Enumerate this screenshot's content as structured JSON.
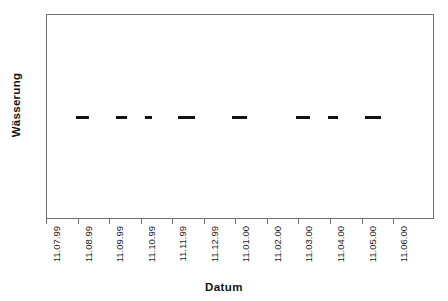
{
  "chart_data": {
    "type": "bar",
    "orientation": "horizontal",
    "title": "",
    "xlabel": "Datum",
    "ylabel": "Wässerung",
    "grid": false,
    "legend": null,
    "categories": [
      "Wässerung"
    ],
    "x_tick_labels": [
      "11.07.99",
      "11.08.99",
      "11.09.99",
      "11.10.99",
      "11.11.99",
      "11.12.99",
      "11.01.00",
      "11.02.00",
      "11.03.00",
      "11.04.00",
      "11.05.00",
      "11.06.00"
    ],
    "x_axis_range": [
      "11.07.99",
      "11.06.00"
    ],
    "y_axis_ticks": [],
    "series": [
      {
        "name": "Wässerung",
        "marker": "horizontal-segment",
        "color": "#121212",
        "segments": [
          {
            "index": 1,
            "start": "01.08.99",
            "end": "13.08.99",
            "x_start_px": 76,
            "x_end_px": 89
          },
          {
            "index": 2,
            "start": "06.09.99",
            "end": "16.09.99",
            "x_start_px": 116,
            "x_end_px": 127
          },
          {
            "index": 3,
            "start": "03.10.99",
            "end": "09.10.99",
            "x_start_px": 145,
            "x_end_px": 152
          },
          {
            "index": 4,
            "start": "01.11.99",
            "end": "17.11.99",
            "x_start_px": 178,
            "x_end_px": 195
          },
          {
            "index": 5,
            "start": "24.12.99",
            "end": "09.01.00",
            "x_start_px": 232,
            "x_end_px": 247
          },
          {
            "index": 6,
            "start": "28.02.00",
            "end": "12.03.00",
            "x_start_px": 296,
            "x_end_px": 310
          },
          {
            "index": 7,
            "start": "01.04.00",
            "end": "11.04.00",
            "x_start_px": 328,
            "x_end_px": 338
          },
          {
            "index": 8,
            "start": "05.05.00",
            "end": "21.05.00",
            "x_start_px": 365,
            "x_end_px": 381
          }
        ]
      }
    ],
    "colors": {
      "background": "#ffffff",
      "frame": "#6f6f6f",
      "mark": "#121212",
      "text": "#111111"
    }
  }
}
